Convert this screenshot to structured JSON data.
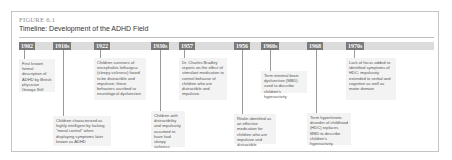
{
  "figure": {
    "label": "FIGURE 6.1",
    "title": "Timeline: Development of the ADHD Field"
  },
  "colors": {
    "year_box": "#7a7a7a",
    "band": "#dcdcdc",
    "desc_bg": "#f3f3f3"
  },
  "events": [
    {
      "year": "1902",
      "text": "First known formal description of ADHD by British physician George Still"
    },
    {
      "year": "1910s",
      "text": "Children characterized as highly intelligent by lacking \"moral control\" when displaying symptoms later known as ADHD"
    },
    {
      "year": "1922",
      "text": "Children survivors of encephalitis lethargica (sleepy sickness) found to be distractible and impulsive; these behaviors ascribed to neurological dysfunction"
    },
    {
      "year": "1930s",
      "text": "Children with distractibility and impulsivity assumed to have had sleepy sickness"
    },
    {
      "year": "1957",
      "text": "Dr. Charles Bradley reports on the effect of stimulant medication to control behavior of children who are distractible and impulsive."
    },
    {
      "year": "1956",
      "text": "Ritalin identified as an effective medication for children who are impulsive and distractible"
    },
    {
      "year": "1960s",
      "text": "Term minimal brain dysfunction (MBD) used to describe children's hyperactivity"
    },
    {
      "year": "1968",
      "text": "Term hyperkinetic disorder of childhood (HDC) replaces MBD to describe children's hyperactivity."
    },
    {
      "year": "1970s",
      "text": "Lack of focus added to identified symptoms of HDC; impulsivity extended to verbal and cognitive as well as motor domain"
    }
  ]
}
